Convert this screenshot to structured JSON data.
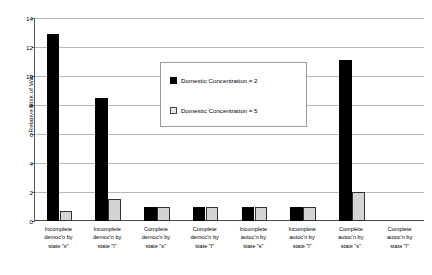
{
  "chart_data": {
    "type": "bar",
    "title": "",
    "xlabel": "",
    "ylabel": "Relative Risk of War",
    "ylim": [
      0,
      14
    ],
    "yticks": [
      0,
      2,
      4,
      6,
      8,
      10,
      12,
      14
    ],
    "grid": true,
    "legend_position": "inside-upper-center",
    "categories": [
      "Incomplete democ'n by state \"s\"",
      "Incomplete democ'n by state \"l\"",
      "Complete democ'n by state \"s\"",
      "Complete democ'n by state \"l\"",
      "Incomplete autoc'n by state \"s\"",
      "Incomplete autoc'n by state \"l\"",
      "Complete autoc'n by state \"s\"",
      "Complete autoc'n by state \"l\""
    ],
    "category_lines": [
      [
        "Incomplete",
        "democ'n by",
        "state \"s\""
      ],
      [
        "Incomplete",
        "democ'n by",
        "state \"l\""
      ],
      [
        "Complete",
        "democ'n by",
        "state \"s\""
      ],
      [
        "Complete",
        "democ'n by",
        "state \"l\""
      ],
      [
        "Incomplete",
        "autoc'n by",
        "state \"s\""
      ],
      [
        "Incomplete",
        "autoc'n by",
        "state \"l\""
      ],
      [
        "Complete",
        "autoc'n by",
        "state \"s\""
      ],
      [
        "Complete",
        "autoc'n by",
        "state \"l\""
      ]
    ],
    "series": [
      {
        "name": "Domestic Concentration = 2",
        "color": "#000000",
        "values": [
          12.9,
          8.5,
          1.0,
          1.0,
          1.0,
          1.0,
          11.1,
          0
        ]
      },
      {
        "name": "Domestic Concentration = 5",
        "color": "#d4d4d4",
        "values": [
          0.7,
          1.5,
          1.0,
          1.0,
          1.0,
          1.0,
          2.0,
          0
        ]
      }
    ]
  },
  "legend": {
    "items": [
      {
        "label": "Domestic Concentration = 2",
        "swatch": "black"
      },
      {
        "label": "Domestic Concentration = 5",
        "swatch": "white"
      }
    ]
  },
  "axes": {
    "y_title": "Relative Risk of War",
    "y_tick_labels": [
      "0",
      "2",
      "4",
      "6",
      "8",
      "10",
      "12",
      "14"
    ]
  }
}
